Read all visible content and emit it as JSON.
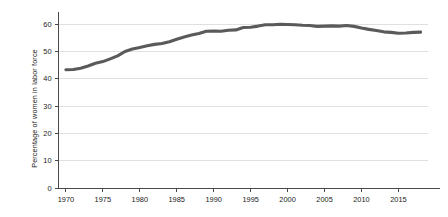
{
  "chart_data": {
    "type": "line",
    "title": "",
    "subtitle": "",
    "xlabel": "",
    "ylabel": "Percentage of women in labor force",
    "xlim": [
      1969,
      2019
    ],
    "ylim": [
      0,
      63
    ],
    "grid": true,
    "grid_axis": "y",
    "legend": "none",
    "y_ticks": [
      0,
      10,
      20,
      30,
      40,
      50,
      60
    ],
    "y_tick_labels": [
      "0",
      "10",
      "20",
      "30",
      "40",
      "50",
      "60"
    ],
    "x_ticks": [
      1970,
      1975,
      1980,
      1985,
      1990,
      1995,
      2000,
      2005,
      2010,
      2015
    ],
    "x_tick_labels": [
      "1970",
      "1975",
      "1980",
      "1985",
      "1990",
      "1995",
      "2000",
      "2005",
      "2010",
      "2015"
    ],
    "series": [
      {
        "name": "Percentage of women in labor force",
        "color": "#5a5a5a",
        "x": [
          1970,
          1971,
          1972,
          1973,
          1974,
          1975,
          1976,
          1977,
          1978,
          1979,
          1980,
          1981,
          1982,
          1983,
          1984,
          1985,
          1986,
          1987,
          1988,
          1989,
          1990,
          1991,
          1992,
          1993,
          1994,
          1995,
          1996,
          1997,
          1998,
          1999,
          2000,
          2001,
          2002,
          2003,
          2004,
          2005,
          2006,
          2007,
          2008,
          2009,
          2010,
          2011,
          2012,
          2013,
          2014,
          2015,
          2016,
          2017,
          2018
        ],
        "values": [
          43.3,
          43.4,
          43.9,
          44.7,
          45.7,
          46.3,
          47.3,
          48.4,
          50.0,
          50.9,
          51.5,
          52.1,
          52.6,
          52.9,
          53.6,
          54.5,
          55.3,
          56.0,
          56.6,
          57.4,
          57.5,
          57.4,
          57.8,
          57.9,
          58.8,
          58.9,
          59.3,
          59.8,
          59.8,
          60.0,
          59.9,
          59.8,
          59.6,
          59.5,
          59.2,
          59.3,
          59.4,
          59.3,
          59.5,
          59.2,
          58.6,
          58.1,
          57.7,
          57.2,
          57.0,
          56.7,
          56.8,
          57.0,
          57.1
        ]
      }
    ],
    "annotations": []
  }
}
